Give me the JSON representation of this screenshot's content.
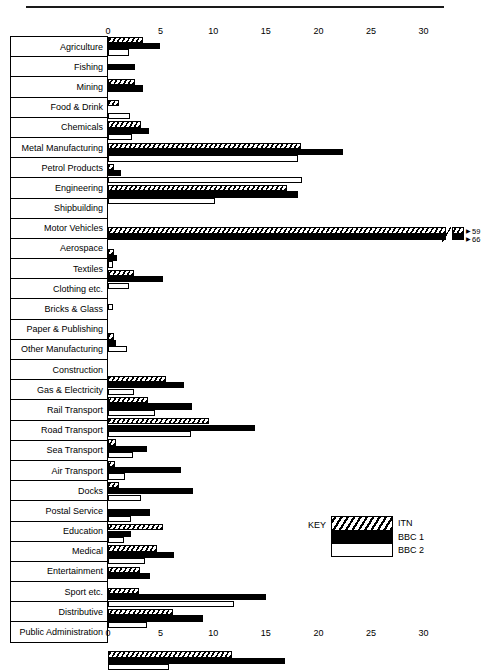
{
  "chart_data": {
    "type": "bar",
    "orientation": "horizontal",
    "title": "",
    "xlabel": "",
    "ylabel": "",
    "xlim": [
      0,
      32
    ],
    "xticks": [
      0,
      5,
      10,
      15,
      20,
      25,
      30
    ],
    "xtick_labels": [
      "0",
      "5",
      "10",
      "15",
      "20",
      "25",
      "30"
    ],
    "grid": false,
    "legend_position": "inside-lower-right",
    "legend_title": "KEY",
    "axis_top_labels": [
      "0",
      "5",
      "10",
      "15",
      "20",
      "25",
      "30"
    ],
    "axis_bottom_labels": [
      "0",
      "5",
      "10",
      "15",
      "20",
      "25",
      "30"
    ],
    "categories": [
      "Agriculture",
      "Fishing",
      "Mining",
      "Food & Drink",
      "Chemicals",
      "Metal Manufacturing",
      "Petrol Products",
      "Engineering",
      "Shipbuilding",
      "Motor Vehicles",
      "Aerospace",
      "Textiles",
      "Clothing etc.",
      "Bricks & Glass",
      "Paper & Publishing",
      "Other Manufacturing",
      "Construction",
      "Gas & Electricity",
      "Rail Transport",
      "Road Transport",
      "Sea Transport",
      "Air Transport",
      "Docks",
      "Postal Service",
      "Education",
      "Medical",
      "Entertainment",
      "Sport etc.",
      "Distributive",
      "Public Administration"
    ],
    "series": [
      {
        "name": "ITN",
        "pattern": "hatched",
        "values": [
          3.3,
          0,
          2.6,
          1.0,
          3.1,
          18.3,
          0.6,
          17.0,
          0,
          59,
          0.6,
          2.5,
          0,
          0,
          0.6,
          0,
          5.5,
          3.8,
          9.6,
          0.8,
          0.7,
          1.0,
          0,
          5.2,
          4.7,
          3.0,
          2.9,
          6.2,
          0,
          11.8
        ]
      },
      {
        "name": "BBC 1",
        "pattern": "solid-black",
        "values": [
          4.9,
          2.6,
          3.3,
          0,
          3.9,
          22.3,
          1.2,
          18.1,
          0,
          66,
          0.9,
          5.2,
          0,
          0,
          0.8,
          0,
          7.2,
          8.0,
          14.0,
          3.7,
          6.9,
          8.1,
          4.0,
          2.2,
          6.3,
          4.0,
          15.0,
          9.0,
          0,
          16.8
        ]
      },
      {
        "name": "BBC 2",
        "pattern": "white",
        "values": [
          2.0,
          0,
          0,
          2.1,
          2.3,
          18.1,
          18.4,
          10.2,
          0,
          0,
          0.4,
          2.0,
          0.5,
          0,
          1.8,
          0,
          2.5,
          4.5,
          7.9,
          2.4,
          1.6,
          3.1,
          2.2,
          1.5,
          3.5,
          0,
          12.0,
          3.7,
          0,
          5.8
        ]
      }
    ],
    "annotations": [
      {
        "category": "Motor Vehicles",
        "series": "ITN",
        "label": "59",
        "note": "axis break, value off-scale"
      },
      {
        "category": "Motor Vehicles",
        "series": "BBC 1",
        "label": "66",
        "note": "axis break, value off-scale"
      }
    ]
  },
  "legend": {
    "title": "KEY",
    "entries": [
      {
        "label": "ITN",
        "swatch": "hatched"
      },
      {
        "label": "BBC 1",
        "swatch": "solid-black"
      },
      {
        "label": "BBC 2",
        "swatch": "white"
      }
    ]
  },
  "colors": {
    "ink": "#000000",
    "paper": "#ffffff",
    "rule": "#1a1a1a"
  }
}
